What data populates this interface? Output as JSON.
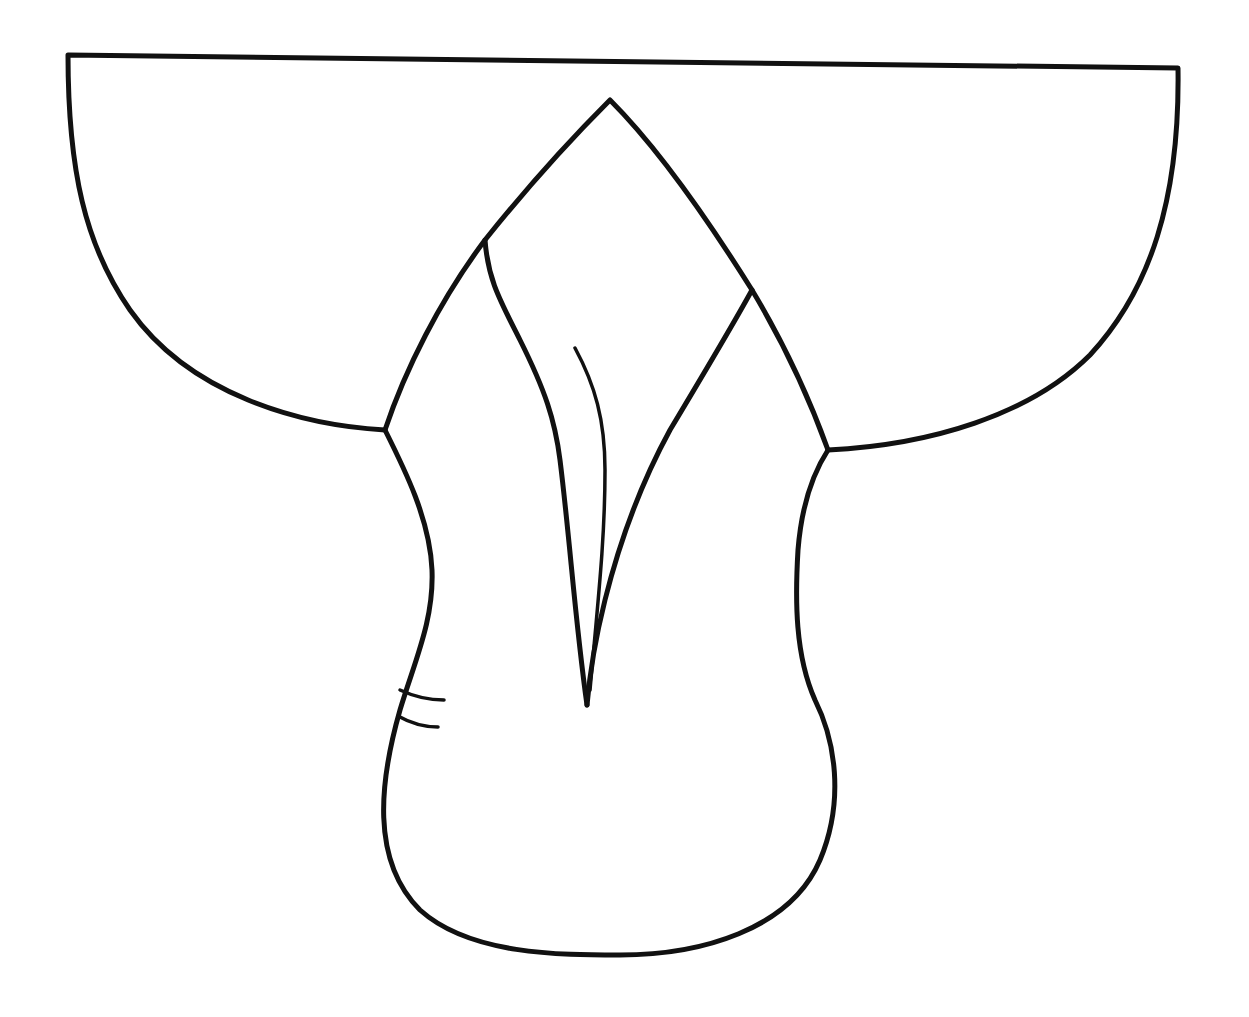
{
  "drawing": {
    "subject": "saddle outline line drawing",
    "background": "#ffffff",
    "stroke": "#111111",
    "stroke_width": 5,
    "thin_stroke_width": 3.5
  }
}
